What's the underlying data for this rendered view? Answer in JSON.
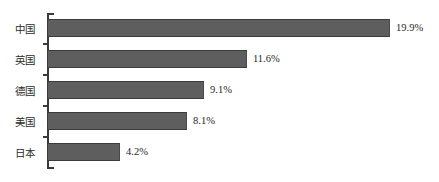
{
  "chart_data": {
    "type": "bar",
    "orientation": "horizontal",
    "title": "",
    "subtitle": "",
    "xlabel": "",
    "ylabel": "",
    "categories": [
      "中国",
      "英国",
      "德国",
      "美国",
      "日本"
    ],
    "values": [
      19.9,
      11.6,
      9.1,
      8.1,
      4.2
    ],
    "value_labels": [
      "19.9%",
      "11.6%",
      "9.1%",
      "8.1%",
      "4.2%"
    ],
    "xlim": [
      0,
      19.9
    ],
    "grid": false,
    "legend": null,
    "series": [
      {
        "name": "",
        "values": [
          19.9,
          11.6,
          9.1,
          8.1,
          4.2
        ]
      }
    ],
    "colors": {
      "bar_fill": "#5e5e5e",
      "bar_edge": "#3c3c3c",
      "axis": "#3a3a3a",
      "label_text": "#2b2b2b",
      "value_text": "#1f1f1f",
      "background": "#ffffff"
    }
  },
  "rows": [
    {
      "label": "中国",
      "value_label": "19.9%"
    },
    {
      "label": "英国",
      "value_label": "11.6%"
    },
    {
      "label": "德国",
      "value_label": "9.1%"
    },
    {
      "label": "美国",
      "value_label": "8.1%"
    },
    {
      "label": "日本",
      "value_label": "4.2%"
    }
  ]
}
